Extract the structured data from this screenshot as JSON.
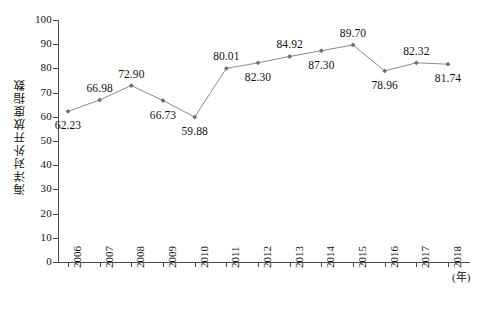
{
  "chart_data": {
    "type": "line",
    "title": "",
    "xlabel": "(年)",
    "ylabel": "海洋对外开放度指数",
    "categories": [
      "2006",
      "2007",
      "2008",
      "2009",
      "2010",
      "2011",
      "2012",
      "2013",
      "2014",
      "2015",
      "2016",
      "2017",
      "2018"
    ],
    "values": [
      62.23,
      66.98,
      72.9,
      66.73,
      59.88,
      80.01,
      82.3,
      84.92,
      87.3,
      89.7,
      78.96,
      82.32,
      81.74
    ],
    "point_labels": [
      "62.23",
      "66.98",
      "72.90",
      "66.73",
      "59.88",
      "80.01",
      "82.30",
      "84.92",
      "87.30",
      "89.70",
      "78.96",
      "82.32",
      "81.74"
    ],
    "label_positions": [
      "below",
      "above",
      "above",
      "below",
      "below",
      "above",
      "below",
      "above",
      "below",
      "above",
      "below",
      "above",
      "below"
    ],
    "ylim": [
      0,
      100
    ],
    "ytick_values": [
      0,
      10,
      20,
      30,
      40,
      50,
      60,
      70,
      80,
      90,
      100
    ],
    "ytick_labels": [
      "0",
      "10",
      "20",
      "30",
      "40",
      "50",
      "60",
      "70",
      "80",
      "90",
      "100"
    ],
    "grid": false,
    "legend": false,
    "series_color": "#8a8a8a",
    "marker_color": "#6f6f6f",
    "axis_color": "#4a4a4a",
    "text_color": "#111111"
  }
}
